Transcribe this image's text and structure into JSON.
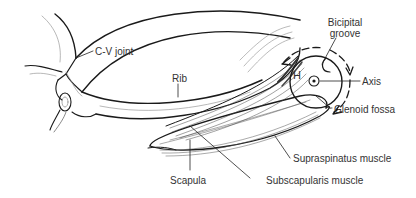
{
  "diagram": {
    "line_color": "#1a1a1a",
    "label_color": "#333333",
    "labels": {
      "cv_joint": "C-V joint",
      "rib": "Rib",
      "bicipital_groove_line1": "Bicipital",
      "bicipital_groove_line2": "groove",
      "humeral_head": "H",
      "axis": "Axis",
      "glenoid_fossa": "Glenoid fossa",
      "supraspinatus": "Supraspinatus muscle",
      "scapula": "Scapula",
      "subscapularis": "Subscapularis muscle"
    }
  }
}
